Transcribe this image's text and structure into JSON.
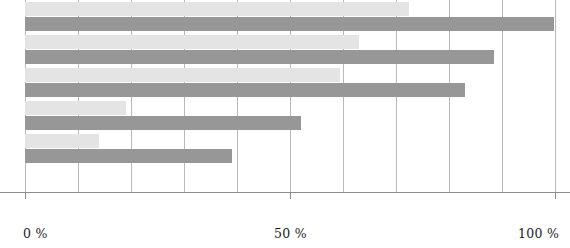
{
  "chart_data": {
    "type": "bar",
    "orientation": "horizontal",
    "title": "",
    "subtitle": "",
    "xlabel": "",
    "ylabel": "",
    "xlim": [
      0,
      100
    ],
    "grid": true,
    "legend": "none",
    "categories": [
      "1",
      "2",
      "3",
      "4",
      "5"
    ],
    "tick_values": [
      0,
      10,
      20,
      30,
      40,
      50,
      60,
      70,
      80,
      90,
      100
    ],
    "tick_labels": [
      "0 %",
      "",
      "",
      "",
      "",
      "50 %",
      "",
      "",
      "",
      "",
      "100 %"
    ],
    "series": [
      {
        "name": "series-light",
        "color": "#e4e4e4",
        "values": [
          72.5,
          63.0,
          59.5,
          19.0,
          14.0
        ]
      },
      {
        "name": "series-dark",
        "color": "#979797",
        "values": [
          99.8,
          88.5,
          83.0,
          52.0,
          39.0
        ]
      }
    ]
  },
  "axis": {
    "line_color": "#8c8c8c",
    "grid_color": "#b9b9b9"
  },
  "geometry": {
    "plot_left": 25,
    "plot_width": 530,
    "plot_height": 192,
    "bar_height": 14,
    "group_pitch": 33,
    "first_light_top": 2,
    "gap_within_group": 15
  }
}
